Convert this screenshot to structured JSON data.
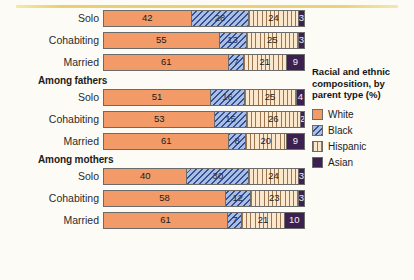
{
  "colors": {
    "white": "#f29a68",
    "black": "#a9bee0",
    "hispanic": "#fbe7cb",
    "asian": "#3c2150",
    "rule": "#e8cf70",
    "background": "#fdfbf6"
  },
  "legend": {
    "title": "Racial and ethnic composition, by parent type (%)",
    "items": [
      {
        "label": "White",
        "key": "white"
      },
      {
        "label": "Black",
        "key": "black"
      },
      {
        "label": "Hispanic",
        "key": "hispanic"
      },
      {
        "label": "Asian",
        "key": "asian"
      }
    ]
  },
  "sections": [
    {
      "heading": "",
      "rows": [
        {
          "label": "Solo",
          "values": [
            42,
            28,
            24,
            3
          ]
        },
        {
          "label": "Cohabiting",
          "values": [
            55,
            13,
            25,
            3
          ]
        },
        {
          "label": "Married",
          "values": [
            61,
            7,
            21,
            9
          ]
        }
      ]
    },
    {
      "heading": "Among fathers",
      "rows": [
        {
          "label": "Solo",
          "values": [
            51,
            16,
            25,
            4
          ]
        },
        {
          "label": "Cohabiting",
          "values": [
            53,
            15,
            26,
            2
          ]
        },
        {
          "label": "Married",
          "values": [
            61,
            8,
            20,
            9
          ]
        }
      ]
    },
    {
      "heading": "Among mothers",
      "rows": [
        {
          "label": "Solo",
          "values": [
            40,
            30,
            24,
            3
          ]
        },
        {
          "label": "Cohabiting",
          "values": [
            58,
            12,
            23,
            3
          ]
        },
        {
          "label": "Married",
          "values": [
            61,
            7,
            21,
            10
          ]
        }
      ]
    }
  ],
  "chart_data": {
    "type": "bar",
    "orientation": "horizontal",
    "stacked": true,
    "normalized": true,
    "title": "Racial and ethnic composition, by parent type (%)",
    "xlabel": "",
    "ylabel": "",
    "xlim": [
      0,
      100
    ],
    "grid": false,
    "legend_position": "right",
    "series": [
      {
        "name": "White",
        "values": [
          42,
          55,
          61,
          51,
          53,
          61,
          40,
          58,
          61
        ]
      },
      {
        "name": "Black",
        "values": [
          28,
          13,
          7,
          16,
          15,
          8,
          30,
          12,
          7
        ]
      },
      {
        "name": "Hispanic",
        "values": [
          24,
          25,
          21,
          25,
          26,
          20,
          24,
          23,
          21
        ]
      },
      {
        "name": "Asian",
        "values": [
          3,
          3,
          9,
          4,
          2,
          9,
          3,
          3,
          10
        ]
      }
    ],
    "categories": [
      "Solo",
      "Cohabiting",
      "Married",
      "Among fathers: Solo",
      "Among fathers: Cohabiting",
      "Among fathers: Married",
      "Among mothers: Solo",
      "Among mothers: Cohabiting",
      "Among mothers: Married"
    ],
    "groups": [
      {
        "heading": "",
        "categories": [
          "Solo",
          "Cohabiting",
          "Married"
        ]
      },
      {
        "heading": "Among fathers",
        "categories": [
          "Solo",
          "Cohabiting",
          "Married"
        ]
      },
      {
        "heading": "Among mothers",
        "categories": [
          "Solo",
          "Cohabiting",
          "Married"
        ]
      }
    ]
  }
}
